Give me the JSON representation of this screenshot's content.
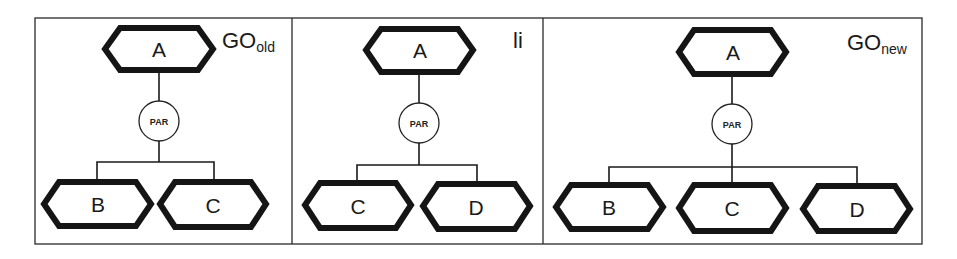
{
  "panels": [
    {
      "id": "go-old",
      "title": {
        "main": "GO",
        "sub": "old"
      },
      "root": "A",
      "operator": "PAR",
      "children": [
        "B",
        "C"
      ]
    },
    {
      "id": "li",
      "title": {
        "main": "li",
        "sub": ""
      },
      "root": "A",
      "operator": "PAR",
      "children": [
        "C",
        "D"
      ]
    },
    {
      "id": "go-new",
      "title": {
        "main": "GO",
        "sub": "new"
      },
      "root": "A",
      "operator": "PAR",
      "children": [
        "B",
        "C",
        "D"
      ]
    }
  ],
  "colors": {
    "stroke": "#151515",
    "background": "#ffffff"
  }
}
